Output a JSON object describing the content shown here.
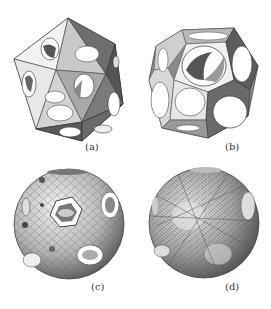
{
  "figure": {
    "panels": [
      {
        "id": "a",
        "label": "(a)",
        "description": "perforated icosahedron shell"
      },
      {
        "id": "b",
        "label": "(b)",
        "description": "perforated dodecahedron shell"
      },
      {
        "id": "c",
        "label": "(c)",
        "description": "spherical lattice with hexagonal and circular openings"
      },
      {
        "id": "d",
        "label": "(d)",
        "description": "dense spherical lattice"
      }
    ]
  }
}
